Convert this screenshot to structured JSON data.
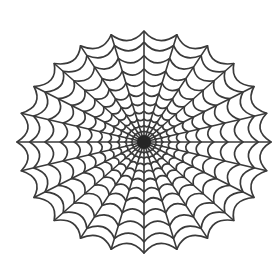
{
  "image": {
    "description": "Spider web illustration",
    "width": 280,
    "height": 259,
    "background": "#ffffff"
  },
  "web": {
    "center": {
      "x": 144,
      "y": 142
    },
    "radius_x": 127,
    "radius_y": 111,
    "spoke_count": 24,
    "ring_fractions": [
      0.05,
      0.1,
      0.15,
      0.21,
      0.28,
      0.36,
      0.45,
      0.55,
      0.66,
      0.78,
      0.9,
      1.0
    ],
    "ring_sag": 0.14,
    "stroke_color": "#3a3a3a",
    "spoke_width": 1.6,
    "ring_width": 1.7,
    "hub_radius": 7,
    "hub_color": "#222222"
  }
}
